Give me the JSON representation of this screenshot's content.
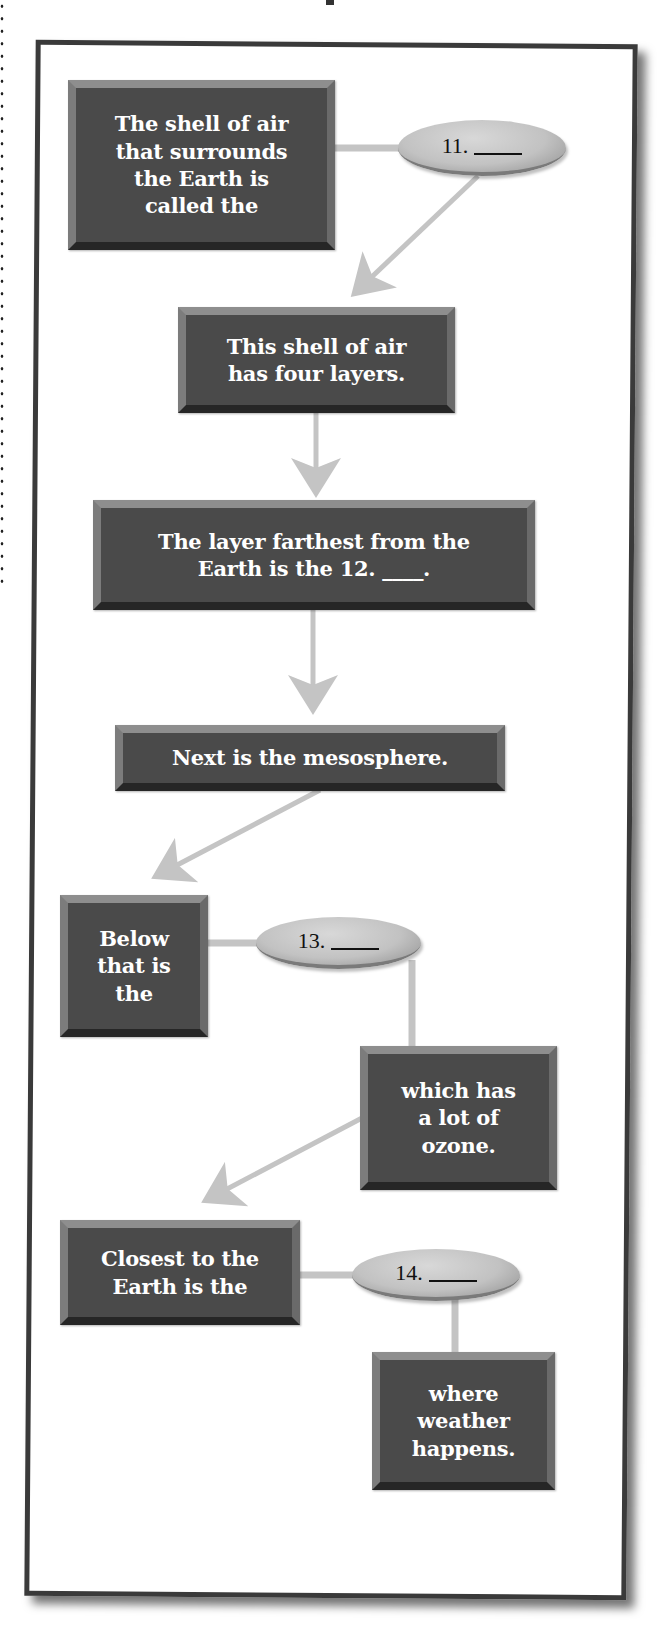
{
  "page": {
    "layout": "vertical flow diagram of Earth's atmosphere layers with fill-in blanks"
  },
  "colors": {
    "box_fill": "#4a4a4a",
    "box_text": "#ffffff",
    "oval_fill": "#c8c8c8",
    "connector": "#c4c4c4",
    "frame_border": "#3a3a3a",
    "background": "#ffffff"
  },
  "diagram": {
    "boxes": [
      {
        "id": "box-1",
        "text": "The shell of air\nthat surrounds\nthe Earth is\ncalled the"
      },
      {
        "id": "box-2",
        "text": "This shell of air\nhas four layers."
      },
      {
        "id": "box-3",
        "text": "The layer farthest from the\nEarth is the 12. ____."
      },
      {
        "id": "box-4",
        "text": "Next is the mesosphere."
      },
      {
        "id": "box-5",
        "text": "Below\nthat is\nthe"
      },
      {
        "id": "box-6",
        "text": "which has\na lot of\nozone."
      },
      {
        "id": "box-7",
        "text": "Closest to the\nEarth is the"
      },
      {
        "id": "box-8",
        "text": "where\nweather\nhappens."
      }
    ],
    "ovals": [
      {
        "id": "oval-11",
        "number": "11."
      },
      {
        "id": "oval-13",
        "number": "13."
      },
      {
        "id": "oval-14",
        "number": "14."
      }
    ],
    "connections": [
      {
        "from": "box-1",
        "to": "oval-11",
        "type": "line"
      },
      {
        "from": "oval-11",
        "to": "box-2",
        "type": "arrow"
      },
      {
        "from": "box-2",
        "to": "box-3",
        "type": "arrow"
      },
      {
        "from": "box-3",
        "to": "box-4",
        "type": "arrow"
      },
      {
        "from": "box-4",
        "to": "box-5",
        "type": "arrow"
      },
      {
        "from": "box-5",
        "to": "oval-13",
        "type": "line"
      },
      {
        "from": "oval-13",
        "to": "box-6",
        "type": "line"
      },
      {
        "from": "box-6",
        "to": "box-7",
        "type": "arrow"
      },
      {
        "from": "box-7",
        "to": "oval-14",
        "type": "line"
      },
      {
        "from": "oval-14",
        "to": "box-8",
        "type": "line"
      }
    ]
  }
}
